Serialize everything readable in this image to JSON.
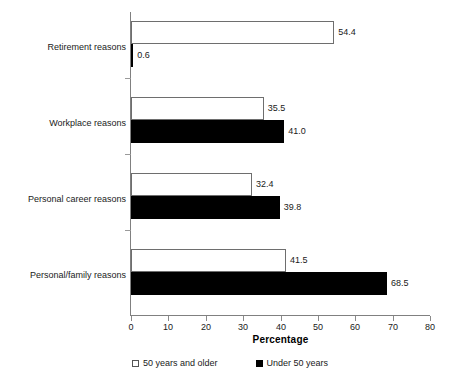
{
  "chart_data": {
    "type": "bar",
    "orientation": "horizontal",
    "title": "",
    "xlabel": "Percentage",
    "ylabel": "",
    "xlim": [
      0,
      80
    ],
    "xticks": [
      0,
      10,
      20,
      30,
      40,
      50,
      60,
      70,
      80
    ],
    "xtick_labels": [
      "0",
      "10",
      "20",
      "30",
      "40",
      "50",
      "60",
      "70",
      "80"
    ],
    "grid": false,
    "legend_position": "bottom",
    "categories": [
      "Retirement reasons",
      "Workplace reasons",
      "Personal career reasons",
      "Personal/family reasons"
    ],
    "series": [
      {
        "name": "50 years and older",
        "color": "#ffffff",
        "edge_color": "#6e6e6e",
        "values": [
          54.4,
          35.5,
          32.4,
          41.5
        ],
        "value_labels": [
          "54.4",
          "35.5",
          "32.4",
          "41.5"
        ]
      },
      {
        "name": "Under 50 years",
        "color": "#000000",
        "edge_color": "#000000",
        "values": [
          0.6,
          41.0,
          39.8,
          68.5
        ],
        "value_labels": [
          "0.6",
          "41.0",
          "39.8",
          "68.5"
        ]
      }
    ]
  },
  "legend": {
    "items": [
      {
        "label": "50 years and older",
        "swatch": "open-square-marker"
      },
      {
        "label": "Under 50 years",
        "swatch": "filled-square-marker"
      }
    ]
  },
  "axis": {
    "x_title": "Percentage"
  }
}
